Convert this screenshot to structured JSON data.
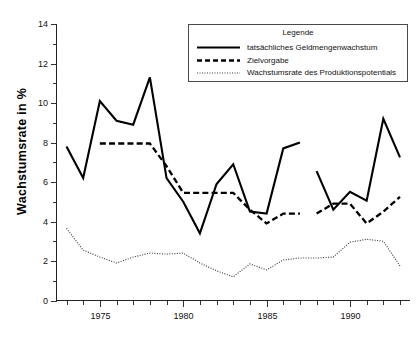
{
  "chart_data": {
    "type": "line",
    "title": "",
    "subtitle": "",
    "xlabel": "",
    "ylabel": "Wachstumsrate in %",
    "xlim": [
      1972.4,
      1993.6
    ],
    "ylim": [
      0,
      14
    ],
    "grid": false,
    "x_ticks_major": [
      1975,
      1980,
      1985,
      1990
    ],
    "x_tick_labels": [
      "1975",
      "1980",
      "1985",
      "1990"
    ],
    "x_ticks_minor_step": 1,
    "y_ticks": [
      0,
      2,
      4,
      6,
      8,
      10,
      12,
      14
    ],
    "y_tick_labels": [
      "0",
      "2",
      "4",
      "6",
      "8",
      "10",
      "12",
      "14"
    ],
    "legend": {
      "position": "top-right-inside",
      "title": "Legende",
      "entries": [
        {
          "label": "tatsächliches Geldmengenwachstum",
          "style": "solid"
        },
        {
          "label": "Zielvorgabe",
          "style": "dashed"
        },
        {
          "label": "Wachstumsrate des Produktionspotentials",
          "style": "dotted"
        }
      ]
    },
    "series": [
      {
        "name": "tatsächliches Geldmengenwachstum",
        "style": "solid",
        "x": [
          1973,
          1974,
          1975,
          1976,
          1977,
          1978,
          1979,
          1980,
          1981,
          1982,
          1983,
          1984,
          1985,
          1986,
          1987,
          1988,
          1989,
          1990,
          1991,
          1992,
          1993
        ],
        "values": [
          7.8,
          6.2,
          10.1,
          9.1,
          8.9,
          11.3,
          6.2,
          5.0,
          3.4,
          5.9,
          6.9,
          4.5,
          4.4,
          7.7,
          8.0,
          6.55,
          4.6,
          5.5,
          5.05,
          9.2,
          7.25
        ],
        "gap_after_x": 1987
      },
      {
        "name": "Zielvorgabe",
        "style": "dashed",
        "x": [
          1975,
          1976,
          1977,
          1978,
          1979,
          1980,
          1981,
          1982,
          1983,
          1984,
          1985,
          1986,
          1987,
          1988,
          1989,
          1990,
          1991,
          1992,
          1993
        ],
        "values": [
          7.95,
          7.95,
          7.95,
          7.95,
          6.8,
          5.45,
          5.45,
          5.45,
          5.45,
          4.6,
          3.9,
          4.4,
          4.4,
          4.4,
          4.9,
          4.9,
          3.9,
          4.5,
          5.25
        ],
        "gap_after_x": 1987
      },
      {
        "name": "Wachstumsrate des Produktionspotentials",
        "style": "dotted",
        "x": [
          1973,
          1974,
          1975,
          1976,
          1977,
          1978,
          1979,
          1980,
          1981,
          1982,
          1983,
          1984,
          1985,
          1986,
          1987,
          1988,
          1989,
          1990,
          1991,
          1992,
          1993
        ],
        "values": [
          3.65,
          2.55,
          2.2,
          1.9,
          2.2,
          2.4,
          2.35,
          2.4,
          1.9,
          1.5,
          1.2,
          1.85,
          1.55,
          2.05,
          2.15,
          2.15,
          2.2,
          2.95,
          3.1,
          3.0,
          1.75
        ],
        "gap_after_x": null
      }
    ],
    "colors": {
      "series_1": "#000000",
      "series_2": "#000000",
      "series_3": "#3b3b3b",
      "axis": "#222222",
      "background": "#ffffff"
    }
  }
}
